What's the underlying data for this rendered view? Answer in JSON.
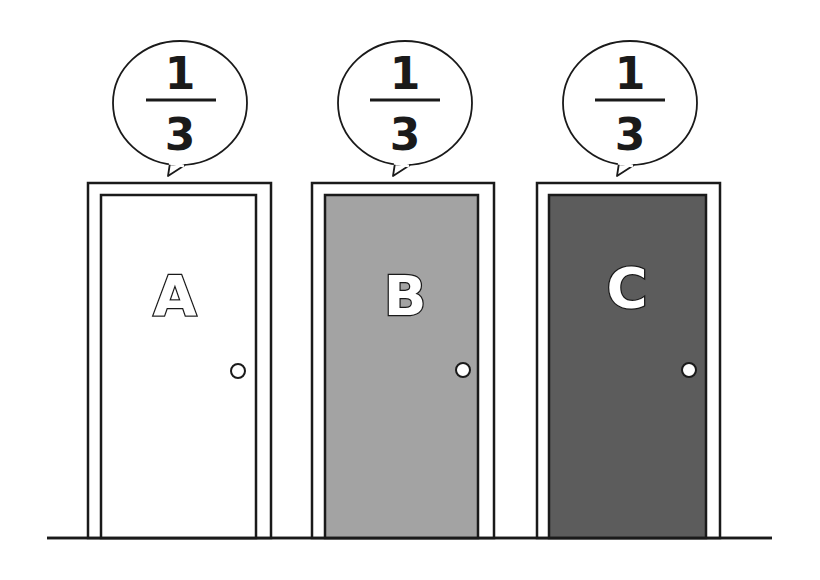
{
  "doors": [
    {
      "label": "A",
      "probability": {
        "numerator": "1",
        "denominator": "3"
      },
      "fill": "#ffffff",
      "frame": {
        "x": 88,
        "y": 183,
        "w": 183,
        "h": 355
      },
      "panel": {
        "x": 101,
        "y": 195,
        "w": 155,
        "h": 343
      },
      "knob": {
        "cx": 238,
        "cy": 371
      },
      "bubble": {
        "cx": 180,
        "cy": 103
      }
    },
    {
      "label": "B",
      "probability": {
        "numerator": "1",
        "denominator": "3"
      },
      "fill": "#a3a3a3",
      "frame": {
        "x": 312,
        "y": 183,
        "w": 182,
        "h": 355
      },
      "panel": {
        "x": 325,
        "y": 195,
        "w": 153,
        "h": 343
      },
      "knob": {
        "cx": 463,
        "cy": 370
      },
      "bubble": {
        "cx": 405,
        "cy": 103
      }
    },
    {
      "label": "C",
      "probability": {
        "numerator": "1",
        "denominator": "3"
      },
      "fill": "#5c5c5c",
      "frame": {
        "x": 537,
        "y": 183,
        "w": 183,
        "h": 355
      },
      "panel": {
        "x": 549,
        "y": 195,
        "w": 157,
        "h": 343
      },
      "knob": {
        "cx": 689,
        "cy": 370
      },
      "bubble": {
        "cx": 630,
        "cy": 103
      }
    }
  ],
  "floor": {
    "x1": 47,
    "x2": 772,
    "y": 538
  },
  "colors": {
    "line": "#1a1a1a",
    "background": "#ffffff"
  }
}
